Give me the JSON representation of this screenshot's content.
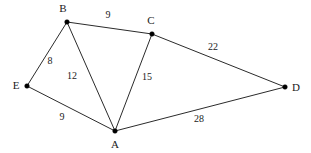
{
  "diagram": {
    "type": "weighted-undirected-graph",
    "background_color": "#ffffff",
    "edge_color": "#2b2b2b",
    "node_color": "#000000",
    "label_color": "#1a1a1a",
    "nodes": [
      {
        "id": "A",
        "label": "A",
        "x": 115,
        "y": 131,
        "label_x": 115,
        "label_y": 145,
        "label_anchor": "middle"
      },
      {
        "id": "B",
        "label": "B",
        "x": 67,
        "y": 22,
        "label_x": 63,
        "label_y": 9,
        "label_anchor": "middle"
      },
      {
        "id": "C",
        "label": "C",
        "x": 152,
        "y": 34,
        "label_x": 151,
        "label_y": 21,
        "label_anchor": "middle"
      },
      {
        "id": "D",
        "label": "D",
        "x": 285,
        "y": 87,
        "label_x": 296,
        "label_y": 88,
        "label_anchor": "middle"
      },
      {
        "id": "E",
        "label": "E",
        "x": 27,
        "y": 86,
        "label_x": 16,
        "label_y": 86,
        "label_anchor": "middle"
      }
    ],
    "edges": [
      {
        "from": "B",
        "to": "C",
        "weight": "9",
        "label_x": 108,
        "label_y": 16
      },
      {
        "from": "E",
        "to": "B",
        "weight": "8",
        "label_x": 50,
        "label_y": 62
      },
      {
        "from": "B",
        "to": "A",
        "weight": "12",
        "label_x": 72,
        "label_y": 77
      },
      {
        "from": "C",
        "to": "A",
        "weight": "15",
        "label_x": 147,
        "label_y": 78
      },
      {
        "from": "C",
        "to": "D",
        "weight": "22",
        "label_x": 213,
        "label_y": 48
      },
      {
        "from": "E",
        "to": "A",
        "weight": "9",
        "label_x": 62,
        "label_y": 118
      },
      {
        "from": "A",
        "to": "D",
        "weight": "28",
        "label_x": 199,
        "label_y": 120
      }
    ]
  }
}
